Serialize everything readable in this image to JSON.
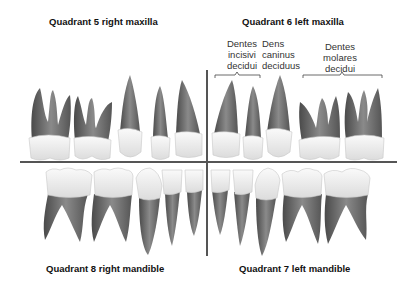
{
  "quadrants": {
    "q5": {
      "label": "Quadrant 5 right maxilla"
    },
    "q6": {
      "label": "Quadrant 6 left maxilla"
    },
    "q8": {
      "label": "Quadrant 8 right mandible"
    },
    "q7": {
      "label": "Quadrant 7 left mandible"
    }
  },
  "annotations": {
    "incisors": {
      "line1": "Dentes",
      "line2": "incisivi",
      "line3": "decidui"
    },
    "canine": {
      "line1": "Dens",
      "line2": "caninus",
      "line3": "deciduus"
    },
    "molars": {
      "line1": "Dentes",
      "line2": "molares",
      "line3": "decidui"
    }
  },
  "colors": {
    "root": "#6e6e6e",
    "root_dark": "#4a4a4a",
    "crown": "#f2f2f2",
    "crown_edge": "#bdbdbd",
    "divider": "#555555"
  }
}
